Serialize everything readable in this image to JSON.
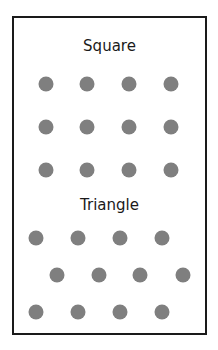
{
  "colors": {
    "border": "#1a1a1a",
    "dot": "#7f7f7f",
    "text": "#1a1a1a",
    "background": "#ffffff"
  },
  "groups": [
    {
      "label": "Square",
      "rows": [
        [
          [
            46,
            84
          ],
          [
            87,
            84
          ],
          [
            129,
            84
          ],
          [
            171,
            84
          ]
        ],
        [
          [
            46,
            127
          ],
          [
            87,
            127
          ],
          [
            129,
            127
          ],
          [
            171,
            127
          ]
        ],
        [
          [
            46,
            170
          ],
          [
            87,
            170
          ],
          [
            129,
            170
          ],
          [
            171,
            170
          ]
        ]
      ]
    },
    {
      "label": "Triangle",
      "rows": [
        [
          [
            36,
            238
          ],
          [
            78,
            238
          ],
          [
            120,
            238
          ],
          [
            162,
            238
          ]
        ],
        [
          [
            57,
            275
          ],
          [
            99,
            275
          ],
          [
            140,
            275
          ],
          [
            183,
            275
          ]
        ],
        [
          [
            36,
            312
          ],
          [
            78,
            312
          ],
          [
            120,
            312
          ],
          [
            162,
            312
          ]
        ]
      ]
    }
  ]
}
